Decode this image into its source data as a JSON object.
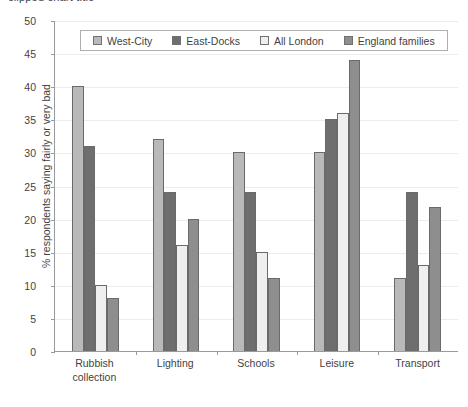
{
  "title": {
    "text": "clipped chart title",
    "visible_fragment": true
  },
  "chart_data": {
    "type": "bar",
    "title": "",
    "xlabel": "",
    "ylabel": "% respondents saying fairly or very bad",
    "ylim": [
      0,
      50
    ],
    "ytick_step": 5,
    "yticks": [
      50,
      45,
      40,
      35,
      30,
      25,
      20,
      15,
      10,
      5,
      0
    ],
    "grid": true,
    "legend_position": "top-inside",
    "categories": [
      "Rubbish collection",
      "Lighting",
      "Schools",
      "Leisure",
      "Transport"
    ],
    "series": [
      {
        "name": "West-City",
        "color": "#b9b9b9",
        "values": [
          40,
          32,
          30,
          30,
          11
        ]
      },
      {
        "name": "East-Docks",
        "color": "#6e6e6e",
        "values": [
          31,
          24,
          24,
          35,
          24
        ]
      },
      {
        "name": "All London",
        "color": "#efefef",
        "values": [
          10,
          16,
          15,
          36,
          13
        ]
      },
      {
        "name": "England families",
        "color": "#8e8e8e",
        "values": [
          8,
          20,
          11,
          44,
          21.7
        ]
      }
    ]
  },
  "axis": {
    "y_title": "% respondents saying fairly or very bad"
  },
  "category_lines": [
    [
      "Rubbish",
      "collection"
    ],
    [
      "Lighting"
    ],
    [
      "Schools"
    ],
    [
      "Leisure"
    ],
    [
      "Transport"
    ]
  ]
}
